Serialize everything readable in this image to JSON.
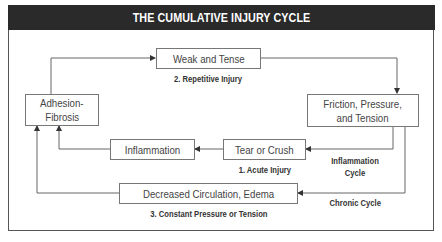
{
  "title": "THE CUMULATIVE INJURY CYCLE",
  "nodes": {
    "weak": "Weak and Tense",
    "friction_line1": "Friction, Pressure,",
    "friction_line2": "and Tension",
    "adhesion_line1": "Adhesion-",
    "adhesion_line2": "Fibrosis",
    "inflammation": "Inflammation",
    "tear": "Tear or Crush",
    "decreased": "Decreased Circulation, Edema"
  },
  "labels": {
    "repetitive": "2. Repetitive Injury",
    "acute": "1. Acute Injury",
    "constant": "3. Constant Pressure or Tension",
    "inflammation_cycle_line1": "Inflammation",
    "inflammation_cycle_line2": "Cycle",
    "chronic_cycle": "Chronic Cycle"
  },
  "colors": {
    "header_bg": "#2a2a2a",
    "header_text": "#ffffff",
    "line": "#666666",
    "box_border": "#777777"
  }
}
